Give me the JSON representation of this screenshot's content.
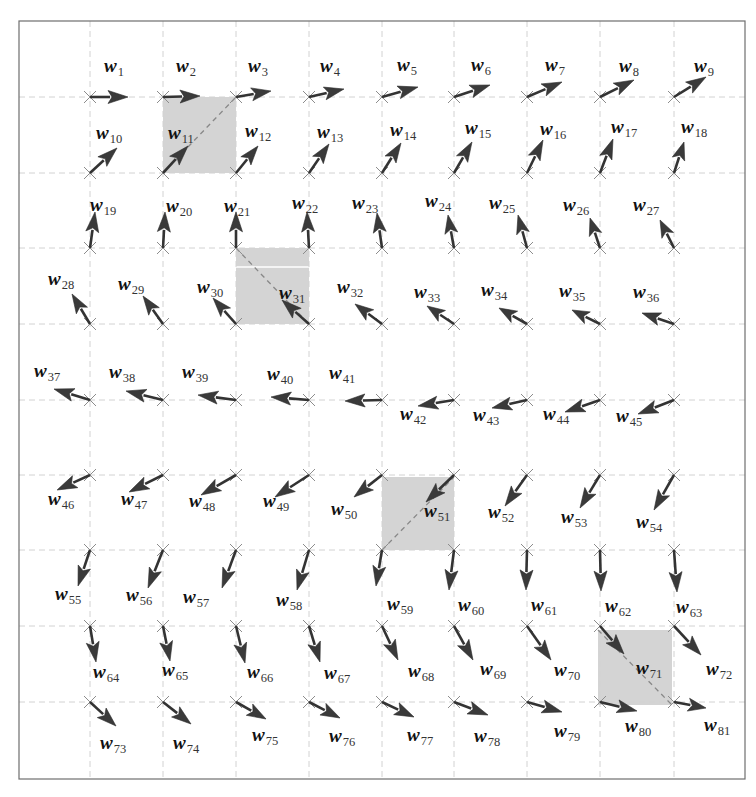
{
  "figure": {
    "title": "Weight vector grid (9x9 self-organizing map)",
    "frame": {
      "x": 19,
      "y": 21,
      "width": 726,
      "height": 758
    },
    "colors": {
      "arrow": "#333333",
      "grid": "#d2d2d2",
      "shade": "#d4d4d4",
      "frame": "#6e6e6e",
      "node": "#8c8c8c"
    },
    "grid_x": [
      90,
      163,
      236,
      309,
      382,
      454,
      527,
      600,
      674
    ],
    "grid_y": [
      97,
      173,
      248,
      324,
      400,
      475,
      550,
      626,
      702
    ],
    "label_symbol": "w",
    "shaded_squares": [
      {
        "name": "square-w11",
        "x": 163,
        "y": 97,
        "w": 73,
        "h": 76,
        "diag": "up",
        "highlight_y": null
      },
      {
        "name": "square-w31",
        "x": 236,
        "y": 248,
        "w": 73,
        "h": 76,
        "diag": "down",
        "highlight_y": 267
      },
      {
        "name": "square-w51",
        "x": 382,
        "y": 477,
        "w": 72,
        "h": 73,
        "diag": "up",
        "highlight_y": null
      },
      {
        "name": "square-w71",
        "x": 598,
        "y": 630,
        "w": 74,
        "h": 75,
        "diag": "down",
        "highlight_y": null
      }
    ],
    "vectors": [
      {
        "id": 1,
        "dx": 38,
        "dy": 0,
        "lx": 104,
        "ly": 72
      },
      {
        "id": 2,
        "dx": 37,
        "dy": -1,
        "lx": 176,
        "ly": 72
      },
      {
        "id": 3,
        "dx": 35,
        "dy": -6,
        "lx": 248,
        "ly": 72
      },
      {
        "id": 4,
        "dx": 35,
        "dy": -8,
        "lx": 320,
        "ly": 72
      },
      {
        "id": 5,
        "dx": 36,
        "dy": -10,
        "lx": 397,
        "ly": 71
      },
      {
        "id": 6,
        "dx": 36,
        "dy": -12,
        "lx": 471,
        "ly": 71
      },
      {
        "id": 7,
        "dx": 35,
        "dy": -15,
        "lx": 545,
        "ly": 71
      },
      {
        "id": 8,
        "dx": 34,
        "dy": -17,
        "lx": 619,
        "ly": 72
      },
      {
        "id": 9,
        "dx": 32,
        "dy": -20,
        "lx": 694,
        "ly": 72
      },
      {
        "id": 10,
        "dx": 27,
        "dy": -25,
        "lx": 96,
        "ly": 139
      },
      {
        "id": 11,
        "dx": 25,
        "dy": -27,
        "lx": 168,
        "ly": 139
      },
      {
        "id": 12,
        "dx": 22,
        "dy": -27,
        "lx": 245,
        "ly": 137
      },
      {
        "id": 13,
        "dx": 20,
        "dy": -29,
        "lx": 317,
        "ly": 138
      },
      {
        "id": 14,
        "dx": 19,
        "dy": -30,
        "lx": 390,
        "ly": 136
      },
      {
        "id": 15,
        "dx": 18,
        "dy": -31,
        "lx": 465,
        "ly": 134
      },
      {
        "id": 16,
        "dx": 16,
        "dy": -33,
        "lx": 540,
        "ly": 135
      },
      {
        "id": 17,
        "dx": 13,
        "dy": -34,
        "lx": 611,
        "ly": 133
      },
      {
        "id": 18,
        "dx": 10,
        "dy": -31,
        "lx": 681,
        "ly": 133
      },
      {
        "id": 19,
        "dx": 5,
        "dy": -36,
        "lx": 90,
        "ly": 211
      },
      {
        "id": 20,
        "dx": 2,
        "dy": -36,
        "lx": 166,
        "ly": 212
      },
      {
        "id": 21,
        "dx": 0,
        "dy": -36,
        "lx": 224,
        "ly": 212
      },
      {
        "id": 22,
        "dx": -2,
        "dy": -36,
        "lx": 292,
        "ly": 209
      },
      {
        "id": 23,
        "dx": -5,
        "dy": -35,
        "lx": 352,
        "ly": 209
      },
      {
        "id": 24,
        "dx": -6,
        "dy": -33,
        "lx": 425,
        "ly": 207
      },
      {
        "id": 25,
        "dx": -9,
        "dy": -33,
        "lx": 489,
        "ly": 209
      },
      {
        "id": 26,
        "dx": -10,
        "dy": -30,
        "lx": 563,
        "ly": 211
      },
      {
        "id": 27,
        "dx": -14,
        "dy": -28,
        "lx": 633,
        "ly": 211
      },
      {
        "id": 28,
        "dx": -18,
        "dy": -30,
        "lx": 48,
        "ly": 285
      },
      {
        "id": 29,
        "dx": -20,
        "dy": -28,
        "lx": 118,
        "ly": 290
      },
      {
        "id": 30,
        "dx": -23,
        "dy": -26,
        "lx": 197,
        "ly": 293
      },
      {
        "id": 31,
        "dx": -27,
        "dy": -24,
        "lx": 279,
        "ly": 299
      },
      {
        "id": 32,
        "dx": -27,
        "dy": -20,
        "lx": 337,
        "ly": 293
      },
      {
        "id": 33,
        "dx": -27,
        "dy": -18,
        "lx": 414,
        "ly": 298
      },
      {
        "id": 34,
        "dx": -28,
        "dy": -16,
        "lx": 481,
        "ly": 296
      },
      {
        "id": 35,
        "dx": -28,
        "dy": -14,
        "lx": 559,
        "ly": 297
      },
      {
        "id": 36,
        "dx": -32,
        "dy": -11,
        "lx": 633,
        "ly": 298
      },
      {
        "id": 37,
        "dx": -36,
        "dy": -11,
        "lx": 34,
        "ly": 377
      },
      {
        "id": 38,
        "dx": -37,
        "dy": -9,
        "lx": 109,
        "ly": 378
      },
      {
        "id": 39,
        "dx": -38,
        "dy": -5,
        "lx": 182,
        "ly": 378
      },
      {
        "id": 40,
        "dx": -38,
        "dy": -3,
        "lx": 267,
        "ly": 380
      },
      {
        "id": 41,
        "dx": -37,
        "dy": 1,
        "lx": 329,
        "ly": 379
      },
      {
        "id": 42,
        "dx": -36,
        "dy": 6,
        "lx": 400,
        "ly": 420
      },
      {
        "id": 43,
        "dx": -35,
        "dy": 8,
        "lx": 473,
        "ly": 421
      },
      {
        "id": 44,
        "dx": -35,
        "dy": 12,
        "lx": 543,
        "ly": 420
      },
      {
        "id": 45,
        "dx": -36,
        "dy": 14,
        "lx": 616,
        "ly": 422
      },
      {
        "id": 46,
        "dx": -33,
        "dy": 15,
        "lx": 48,
        "ly": 505
      },
      {
        "id": 47,
        "dx": -34,
        "dy": 17,
        "lx": 121,
        "ly": 505
      },
      {
        "id": 48,
        "dx": -35,
        "dy": 20,
        "lx": 189,
        "ly": 507
      },
      {
        "id": 49,
        "dx": -34,
        "dy": 22,
        "lx": 263,
        "ly": 507
      },
      {
        "id": 50,
        "dx": -28,
        "dy": 22,
        "lx": 331,
        "ly": 515
      },
      {
        "id": 51,
        "dx": -28,
        "dy": 27,
        "lx": 424,
        "ly": 517
      },
      {
        "id": 52,
        "dx": -22,
        "dy": 31,
        "lx": 488,
        "ly": 518
      },
      {
        "id": 53,
        "dx": -20,
        "dy": 33,
        "lx": 561,
        "ly": 523
      },
      {
        "id": 54,
        "dx": -20,
        "dy": 35,
        "lx": 636,
        "ly": 528
      },
      {
        "id": 55,
        "dx": -12,
        "dy": 36,
        "lx": 55,
        "ly": 600
      },
      {
        "id": 56,
        "dx": -15,
        "dy": 38,
        "lx": 126,
        "ly": 601
      },
      {
        "id": 57,
        "dx": -14,
        "dy": 38,
        "lx": 183,
        "ly": 603
      },
      {
        "id": 58,
        "dx": -12,
        "dy": 40,
        "lx": 276,
        "ly": 606
      },
      {
        "id": 59,
        "dx": -6,
        "dy": 36,
        "lx": 387,
        "ly": 610
      },
      {
        "id": 60,
        "dx": -5,
        "dy": 40,
        "lx": 458,
        "ly": 611
      },
      {
        "id": 61,
        "dx": -1,
        "dy": 40,
        "lx": 531,
        "ly": 611
      },
      {
        "id": 62,
        "dx": 1,
        "dy": 41,
        "lx": 605,
        "ly": 612
      },
      {
        "id": 63,
        "dx": 3,
        "dy": 42,
        "lx": 676,
        "ly": 613
      },
      {
        "id": 64,
        "dx": 6,
        "dy": 36,
        "lx": 93,
        "ly": 678
      },
      {
        "id": 65,
        "dx": 7,
        "dy": 35,
        "lx": 162,
        "ly": 676
      },
      {
        "id": 66,
        "dx": 9,
        "dy": 37,
        "lx": 247,
        "ly": 678
      },
      {
        "id": 67,
        "dx": 11,
        "dy": 36,
        "lx": 324,
        "ly": 679
      },
      {
        "id": 68,
        "dx": 16,
        "dy": 34,
        "lx": 408,
        "ly": 677
      },
      {
        "id": 69,
        "dx": 19,
        "dy": 34,
        "lx": 480,
        "ly": 675
      },
      {
        "id": 70,
        "dx": 24,
        "dy": 34,
        "lx": 554,
        "ly": 676
      },
      {
        "id": 71,
        "dx": 24,
        "dy": 28,
        "lx": 636,
        "ly": 674
      },
      {
        "id": 72,
        "dx": 27,
        "dy": 29,
        "lx": 706,
        "ly": 675
      },
      {
        "id": 73,
        "dx": 26,
        "dy": 24,
        "lx": 100,
        "ly": 749
      },
      {
        "id": 74,
        "dx": 28,
        "dy": 22,
        "lx": 173,
        "ly": 749
      },
      {
        "id": 75,
        "dx": 30,
        "dy": 17,
        "lx": 252,
        "ly": 741
      },
      {
        "id": 76,
        "dx": 31,
        "dy": 16,
        "lx": 329,
        "ly": 742
      },
      {
        "id": 77,
        "dx": 32,
        "dy": 15,
        "lx": 407,
        "ly": 741
      },
      {
        "id": 78,
        "dx": 34,
        "dy": 13,
        "lx": 474,
        "ly": 742
      },
      {
        "id": 79,
        "dx": 35,
        "dy": 10,
        "lx": 554,
        "ly": 737
      },
      {
        "id": 80,
        "dx": 37,
        "dy": 9,
        "lx": 625,
        "ly": 732
      },
      {
        "id": 81,
        "dx": 32,
        "dy": 6,
        "lx": 704,
        "ly": 731
      }
    ]
  }
}
